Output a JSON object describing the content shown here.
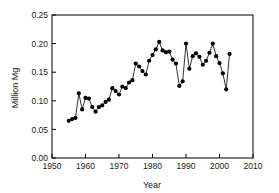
{
  "chart_data": {
    "type": "line",
    "title": "",
    "subtitle": "",
    "xlabel": "Year",
    "ylabel": "Million Mg",
    "xlim": [
      1950,
      2010
    ],
    "ylim": [
      0.0,
      0.25
    ],
    "xticks": [
      1950,
      1960,
      1970,
      1980,
      1990,
      2000,
      2010
    ],
    "xtick_labels": [
      "1950",
      "1960",
      "1970",
      "1980",
      "1990",
      "2000",
      "2010"
    ],
    "yticks": [
      0.0,
      0.05,
      0.1,
      0.15,
      0.2,
      0.25
    ],
    "ytick_labels": [
      "0.00",
      "0.05",
      "0.10",
      "0.15",
      "0.20",
      "0.25"
    ],
    "grid": false,
    "legend": false,
    "legend_position": "none",
    "marker": "filled-circle",
    "marker_color": "#000000",
    "line_color": "#000000",
    "background_color": "#ffffff",
    "x": [
      1955,
      1956,
      1957,
      1958,
      1959,
      1960,
      1961,
      1962,
      1963,
      1964,
      1965,
      1966,
      1967,
      1968,
      1969,
      1970,
      1971,
      1972,
      1973,
      1974,
      1975,
      1976,
      1977,
      1978,
      1979,
      1980,
      1981,
      1982,
      1983,
      1984,
      1985,
      1986,
      1987,
      1988,
      1989,
      1990,
      1991,
      1992,
      1993,
      1994,
      1995,
      1996,
      1997,
      1998,
      1999,
      2000,
      2001,
      2002,
      2003
    ],
    "values": [
      0.065,
      0.068,
      0.07,
      0.113,
      0.085,
      0.105,
      0.104,
      0.089,
      0.081,
      0.089,
      0.092,
      0.098,
      0.102,
      0.122,
      0.117,
      0.111,
      0.125,
      0.122,
      0.132,
      0.136,
      0.165,
      0.16,
      0.152,
      0.146,
      0.17,
      0.18,
      0.19,
      0.203,
      0.188,
      0.185,
      0.186,
      0.172,
      0.165,
      0.126,
      0.134,
      0.2,
      0.156,
      0.178,
      0.183,
      0.177,
      0.163,
      0.17,
      0.184,
      0.2,
      0.178,
      0.166,
      0.148,
      0.12,
      0.182
    ],
    "series": [
      {
        "name": "Million Mg",
        "values": [
          0.065,
          0.068,
          0.07,
          0.113,
          0.085,
          0.105,
          0.104,
          0.089,
          0.081,
          0.089,
          0.092,
          0.098,
          0.102,
          0.122,
          0.117,
          0.111,
          0.125,
          0.122,
          0.132,
          0.136,
          0.165,
          0.16,
          0.152,
          0.146,
          0.17,
          0.18,
          0.19,
          0.203,
          0.188,
          0.185,
          0.186,
          0.172,
          0.165,
          0.126,
          0.134,
          0.2,
          0.156,
          0.178,
          0.183,
          0.177,
          0.163,
          0.17,
          0.184,
          0.2,
          0.178,
          0.166,
          0.148,
          0.12,
          0.182
        ]
      }
    ]
  }
}
